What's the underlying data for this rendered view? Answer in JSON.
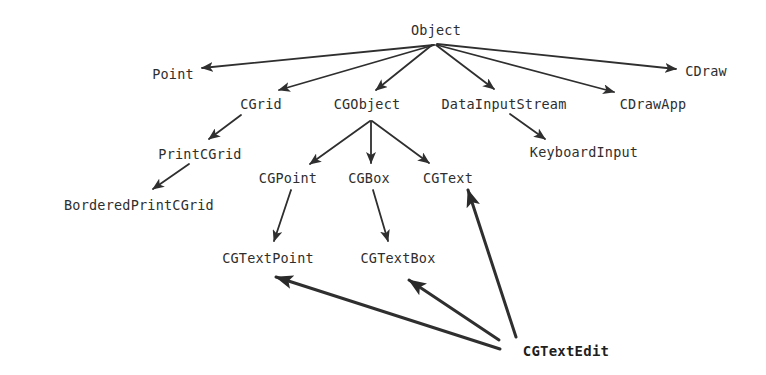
{
  "diagram": {
    "type": "class-hierarchy",
    "colors": {
      "background": "#ffffff",
      "text": "#2e2e2e",
      "edge": "#2f2f2f"
    },
    "nodes": [
      {
        "id": "Object",
        "label": "Object",
        "x": 436,
        "y": 30,
        "bold": false
      },
      {
        "id": "Point",
        "label": "Point",
        "x": 173,
        "y": 74,
        "bold": false
      },
      {
        "id": "CDraw",
        "label": "CDraw",
        "x": 706,
        "y": 71,
        "bold": false
      },
      {
        "id": "CGrid",
        "label": "CGrid",
        "x": 261,
        "y": 104,
        "bold": false
      },
      {
        "id": "CGObject",
        "label": "CGObject",
        "x": 367,
        "y": 104,
        "bold": false
      },
      {
        "id": "DataInputStream",
        "label": "DataInputStream",
        "x": 504,
        "y": 104,
        "bold": false
      },
      {
        "id": "CDrawApp",
        "label": "CDrawApp",
        "x": 653,
        "y": 104,
        "bold": false
      },
      {
        "id": "PrintCGrid",
        "label": "PrintCGrid",
        "x": 200,
        "y": 154,
        "bold": false
      },
      {
        "id": "KeyboardInput",
        "label": "KeyboardInput",
        "x": 584,
        "y": 152,
        "bold": false
      },
      {
        "id": "CGPoint",
        "label": "CGPoint",
        "x": 288,
        "y": 178,
        "bold": false
      },
      {
        "id": "CGBox",
        "label": "CGBox",
        "x": 369,
        "y": 178,
        "bold": false
      },
      {
        "id": "CGText",
        "label": "CGText",
        "x": 448,
        "y": 178,
        "bold": false
      },
      {
        "id": "BorderedPrintCGrid",
        "label": "BorderedPrintCGrid",
        "x": 139,
        "y": 205,
        "bold": false
      },
      {
        "id": "CGTextPoint",
        "label": "CGTextPoint",
        "x": 268,
        "y": 258,
        "bold": false
      },
      {
        "id": "CGTextBox",
        "label": "CGTextBox",
        "x": 398,
        "y": 258,
        "bold": false
      },
      {
        "id": "CGTextEdit",
        "label": "CGTextEdit",
        "x": 566,
        "y": 351,
        "bold": true
      }
    ],
    "edges": [
      {
        "from": "Object",
        "to": "Point",
        "x1": 434,
        "y1": 45,
        "x2": 202,
        "y2": 68,
        "heavy": false
      },
      {
        "from": "Object",
        "to": "CGrid",
        "x1": 434,
        "y1": 45,
        "x2": 279,
        "y2": 90,
        "heavy": false
      },
      {
        "from": "Object",
        "to": "CGObject",
        "x1": 432,
        "y1": 45,
        "x2": 376,
        "y2": 90,
        "heavy": false
      },
      {
        "from": "Object",
        "to": "DataInputStream",
        "x1": 436,
        "y1": 45,
        "x2": 494,
        "y2": 89,
        "heavy": false
      },
      {
        "from": "Object",
        "to": "CDrawApp",
        "x1": 437,
        "y1": 45,
        "x2": 614,
        "y2": 92,
        "heavy": false
      },
      {
        "from": "Object",
        "to": "CDraw",
        "x1": 437,
        "y1": 44,
        "x2": 676,
        "y2": 69,
        "heavy": false
      },
      {
        "from": "CGrid",
        "to": "PrintCGrid",
        "x1": 241,
        "y1": 115,
        "x2": 209,
        "y2": 139,
        "heavy": false
      },
      {
        "from": "PrintCGrid",
        "to": "BorderedPrintCGrid",
        "x1": 189,
        "y1": 164,
        "x2": 153,
        "y2": 189,
        "heavy": false
      },
      {
        "from": "CGObject",
        "to": "CGPoint",
        "x1": 370,
        "y1": 121,
        "x2": 310,
        "y2": 164,
        "heavy": false
      },
      {
        "from": "CGObject",
        "to": "CGBox",
        "x1": 371,
        "y1": 121,
        "x2": 371,
        "y2": 163,
        "heavy": false
      },
      {
        "from": "CGObject",
        "to": "CGText",
        "x1": 372,
        "y1": 121,
        "x2": 429,
        "y2": 163,
        "heavy": false
      },
      {
        "from": "DataInputStream",
        "to": "KeyboardInput",
        "x1": 510,
        "y1": 114,
        "x2": 545,
        "y2": 139,
        "heavy": false
      },
      {
        "from": "CGPoint",
        "to": "CGTextPoint",
        "x1": 291,
        "y1": 190,
        "x2": 274,
        "y2": 241,
        "heavy": false
      },
      {
        "from": "CGBox",
        "to": "CGTextBox",
        "x1": 373,
        "y1": 190,
        "x2": 388,
        "y2": 241,
        "heavy": false
      },
      {
        "from": "CGTextEdit",
        "to": "CGTextPoint",
        "x1": 500,
        "y1": 349,
        "x2": 276,
        "y2": 277,
        "heavy": true
      },
      {
        "from": "CGTextEdit",
        "to": "CGTextBox",
        "x1": 499,
        "y1": 340,
        "x2": 409,
        "y2": 280,
        "heavy": true
      },
      {
        "from": "CGTextEdit",
        "to": "CGText",
        "x1": 516,
        "y1": 337,
        "x2": 468,
        "y2": 190,
        "heavy": true
      }
    ]
  }
}
